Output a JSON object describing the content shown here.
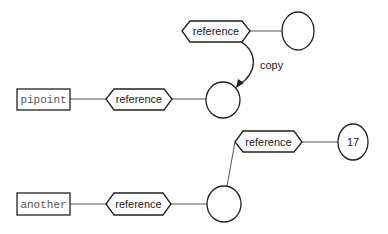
{
  "diagram": {
    "colors": {
      "stroke": "#222222",
      "line": "#555555",
      "background": "#ffffff",
      "mono_text": "#555555"
    },
    "nodes": {
      "pipoint": {
        "label": "pipoint",
        "shape": "rectangle"
      },
      "another": {
        "label": "another",
        "shape": "rectangle"
      },
      "ref_top": {
        "label": "reference",
        "shape": "hexagon"
      },
      "ref_mid": {
        "label": "reference",
        "shape": "hexagon"
      },
      "ref_low_right": {
        "label": "reference",
        "shape": "hexagon"
      },
      "ref_bottom": {
        "label": "reference",
        "shape": "hexagon"
      },
      "obj_top_right": {
        "label": "",
        "shape": "circle"
      },
      "obj_mid": {
        "label": "",
        "shape": "circle"
      },
      "obj_bottom": {
        "label": "",
        "shape": "circle"
      },
      "obj_17": {
        "label": "17",
        "shape": "circle"
      }
    },
    "edges": {
      "copy_label": "copy"
    }
  }
}
